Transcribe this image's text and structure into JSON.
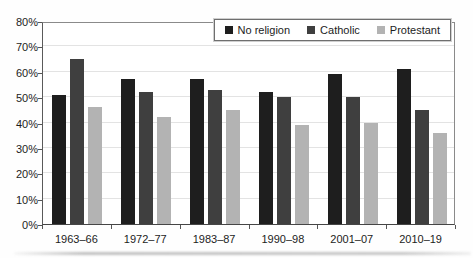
{
  "chart_data": {
    "type": "bar",
    "title": "",
    "xlabel": "",
    "ylabel": "",
    "categories": [
      "1963–66",
      "1972–77",
      "1983–87",
      "1990–98",
      "2001–07",
      "2010–19"
    ],
    "series": [
      {
        "name": "No religion",
        "color": "#1e1e1e",
        "values": [
          51,
          57,
          57,
          52,
          59,
          61
        ]
      },
      {
        "name": "Catholic",
        "color": "#3f3f3f",
        "values": [
          65,
          52,
          53,
          50,
          50,
          45
        ]
      },
      {
        "name": "Protestant",
        "color": "#b3b3b3",
        "values": [
          46,
          42,
          45,
          39,
          40,
          36
        ]
      }
    ],
    "ylim": [
      0,
      80
    ],
    "ytick_step": 10,
    "ytick_labels": [
      "0%",
      "10%",
      "20%",
      "30%",
      "40%",
      "50%",
      "60%",
      "70%",
      "80%"
    ],
    "grid": true,
    "legend_position": "top-right"
  },
  "style": {
    "gridline_color": "#e3e3e3",
    "frame_color": "#8a8a8a",
    "text_color": "#1c1c1c",
    "background": "#fefefe"
  }
}
